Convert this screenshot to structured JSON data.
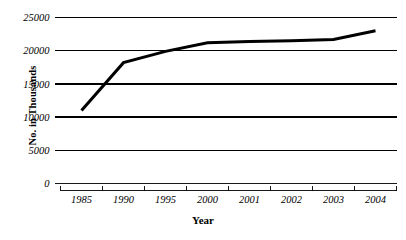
{
  "chart_data": {
    "type": "line",
    "title": "",
    "xlabel": "Year",
    "ylabel": "No. in Thousands",
    "categories": [
      "1985",
      "1990",
      "1995",
      "2000",
      "2001",
      "2002",
      "2003",
      "2004"
    ],
    "values": [
      11000,
      18200,
      19900,
      21200,
      21400,
      21500,
      21700,
      23000
    ],
    "series": [
      {
        "name": "No. in Thousands",
        "values": [
          11000,
          18200,
          19900,
          21200,
          21400,
          21500,
          21700,
          23000
        ],
        "color": "#000000"
      }
    ],
    "ylim": [
      0,
      25000
    ],
    "yticks": [
      0,
      5000,
      10000,
      15000,
      20000,
      25000
    ],
    "ytick_labels": [
      "0",
      "5000",
      "10000",
      "15000",
      "20000",
      "25000"
    ],
    "xtick_labels": [
      "1985",
      "1990",
      "1995",
      "2000",
      "2001",
      "2002",
      "2003",
      "2004"
    ],
    "grid": true,
    "grid_axis": "y",
    "legend": false,
    "legend_position": "none",
    "line_color": "#000000",
    "line_width": 3,
    "markers": false,
    "background_color": "#ffffff",
    "axis_color": "#000000"
  },
  "axes": {
    "y_title": "No. in Thousands",
    "x_title": "Year"
  }
}
